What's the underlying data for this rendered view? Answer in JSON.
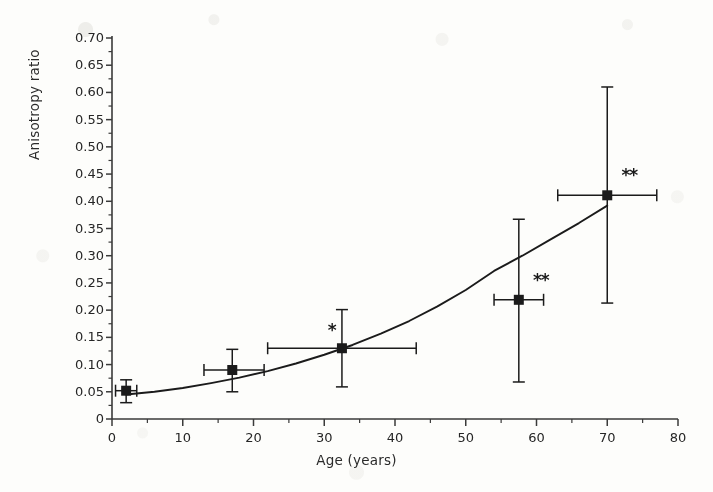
{
  "chart_data": {
    "type": "scatter",
    "title": "",
    "xlabel": "Age (years)",
    "ylabel": "Anisotropy ratio",
    "xlim": [
      0,
      80
    ],
    "ylim": [
      0,
      0.7
    ],
    "grid": false,
    "legend": "none",
    "xticks": [
      "0",
      "10",
      "20",
      "30",
      "40",
      "50",
      "60",
      "70",
      "80"
    ],
    "xtick_values": [
      0,
      10,
      20,
      30,
      40,
      50,
      60,
      70,
      80
    ],
    "xminor_interval": 5,
    "yticks": [
      "0",
      "0.05",
      "0.10",
      "0.15",
      "0.20",
      "0.25",
      "0.30",
      "0.35",
      "0.40",
      "0.45",
      "0.50",
      "0.55",
      "0.60",
      "0.65",
      "0.70"
    ],
    "ytick_values": [
      0,
      0.05,
      0.1,
      0.15,
      0.2,
      0.25,
      0.3,
      0.35,
      0.4,
      0.45,
      0.5,
      0.55,
      0.6,
      0.65,
      0.7
    ],
    "yminor_interval": 0.025,
    "marker": "filled-square",
    "series": [
      {
        "name": "Anisotropy ratio vs age",
        "points": [
          {
            "x": 2.0,
            "y": 0.052,
            "xerr_low": 0.5,
            "xerr_high": 3.5,
            "yerr_low": 0.03,
            "yerr_high": 0.072,
            "significance": ""
          },
          {
            "x": 17.0,
            "y": 0.09,
            "xerr_low": 13.0,
            "xerr_high": 21.5,
            "yerr_low": 0.05,
            "yerr_high": 0.128,
            "significance": ""
          },
          {
            "x": 32.5,
            "y": 0.13,
            "xerr_low": 22.0,
            "xerr_high": 43.0,
            "yerr_low": 0.059,
            "yerr_high": 0.201,
            "significance": "*"
          },
          {
            "x": 57.5,
            "y": 0.219,
            "xerr_low": 54.0,
            "xerr_high": 61.0,
            "yerr_low": 0.068,
            "yerr_high": 0.367,
            "significance": "**"
          },
          {
            "x": 70.0,
            "y": 0.411,
            "xerr_low": 63.0,
            "xerr_high": 77.0,
            "yerr_low": 0.213,
            "yerr_high": 0.61,
            "significance": "**"
          }
        ]
      }
    ],
    "fit_curve": {
      "name": "exponential regression",
      "x_start": 2.0,
      "x_end": 70.0,
      "points": [
        {
          "x": 2,
          "y": 0.045
        },
        {
          "x": 6,
          "y": 0.05
        },
        {
          "x": 10,
          "y": 0.057
        },
        {
          "x": 14,
          "y": 0.066
        },
        {
          "x": 18,
          "y": 0.076
        },
        {
          "x": 22,
          "y": 0.088
        },
        {
          "x": 26,
          "y": 0.102
        },
        {
          "x": 30,
          "y": 0.118
        },
        {
          "x": 34,
          "y": 0.136
        },
        {
          "x": 38,
          "y": 0.157
        },
        {
          "x": 42,
          "y": 0.18
        },
        {
          "x": 46,
          "y": 0.207
        },
        {
          "x": 50,
          "y": 0.237
        },
        {
          "x": 54,
          "y": 0.272
        },
        {
          "x": 58,
          "y": 0.3
        },
        {
          "x": 62,
          "y": 0.33
        },
        {
          "x": 66,
          "y": 0.36
        },
        {
          "x": 70,
          "y": 0.392
        }
      ]
    },
    "annotations": [
      {
        "text": "*",
        "x": 30.5,
        "y": 0.162
      },
      {
        "text": "**",
        "x": 59.5,
        "y": 0.253
      },
      {
        "text": "**",
        "x": 72.0,
        "y": 0.447
      }
    ]
  },
  "colors": {
    "ink": "#1b1b1b",
    "axis": "#3a3a3a",
    "background": "#fdfdfb"
  }
}
